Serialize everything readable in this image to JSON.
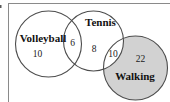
{
  "figure": {
    "type": "venn-diagram",
    "colors": {
      "background": "#ffffff",
      "circle_stroke": "#4d4d4d",
      "shaded_fill": "#d2d2d2",
      "unshaded_fill": "#ffffff",
      "frame_line": "#8a8a8a",
      "artifact": "#5a5a5a"
    },
    "sets": {
      "volleyball": {
        "label": "Volleyball",
        "value": "10",
        "shaded": false
      },
      "tennis": {
        "label": "Tennis",
        "value": "8",
        "shaded": false
      },
      "walking": {
        "label": "Walking",
        "value": "22",
        "shaded": true
      }
    },
    "intersections": {
      "volleyball_tennis": {
        "value": "6"
      },
      "tennis_walking": {
        "value": "10"
      }
    }
  }
}
